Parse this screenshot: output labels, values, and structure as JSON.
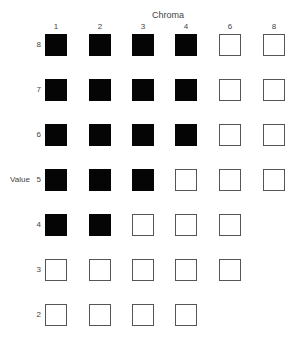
{
  "chroma_title": "Chroma",
  "value_title": "Value",
  "columns": [
    "1",
    "2",
    "3",
    "4",
    "6",
    "8"
  ],
  "rows": [
    {
      "label": "8",
      "cells": [
        "filled",
        "filled",
        "filled",
        "filled",
        "empty",
        "empty"
      ]
    },
    {
      "label": "7",
      "cells": [
        "filled",
        "filled",
        "filled",
        "filled",
        "empty",
        "empty"
      ]
    },
    {
      "label": "6",
      "cells": [
        "filled",
        "filled",
        "filled",
        "filled",
        "empty",
        "empty"
      ]
    },
    {
      "label": "5",
      "cells": [
        "filled",
        "filled",
        "filled",
        "empty",
        "empty",
        "empty"
      ]
    },
    {
      "label": "4",
      "cells": [
        "filled",
        "filled",
        "empty",
        "empty",
        "empty",
        null
      ]
    },
    {
      "label": "3",
      "cells": [
        "empty",
        "empty",
        "empty",
        "empty",
        "empty",
        null
      ]
    },
    {
      "label": "2",
      "cells": [
        "empty",
        "empty",
        "empty",
        "empty",
        null,
        null
      ]
    }
  ],
  "colors": {
    "filled": "#050505",
    "empty_border": "#555555"
  }
}
